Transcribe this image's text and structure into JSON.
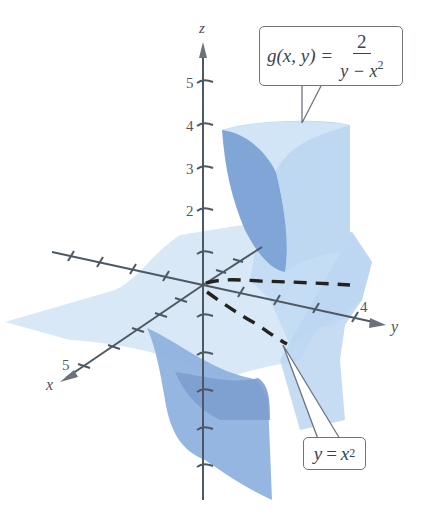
{
  "figure": {
    "type": "3D surface plot",
    "function_label": {
      "lhs": "g(x, y)",
      "equals": "=",
      "numerator": "2",
      "denominator_prefix": "y − x",
      "denominator_exponent": "2"
    },
    "curve_label": {
      "lhs": "y",
      "equals": "=",
      "rhs": "x",
      "exponent": "2"
    },
    "axes": {
      "z": {
        "label": "z",
        "tick_labels": [
          "2",
          "3",
          "4",
          "5"
        ]
      },
      "y": {
        "label": "y",
        "tick_labels": [
          "4"
        ]
      },
      "x": {
        "label": "x",
        "tick_labels": [
          "5"
        ]
      }
    },
    "colors": {
      "surface_light": "#cfe3f6",
      "surface_mid": "#a9c8ec",
      "surface_dark": "#7ea7d8",
      "axis": "#4d5863",
      "dashed_curve": "#222222",
      "callout_border": "#6d7480"
    }
  }
}
